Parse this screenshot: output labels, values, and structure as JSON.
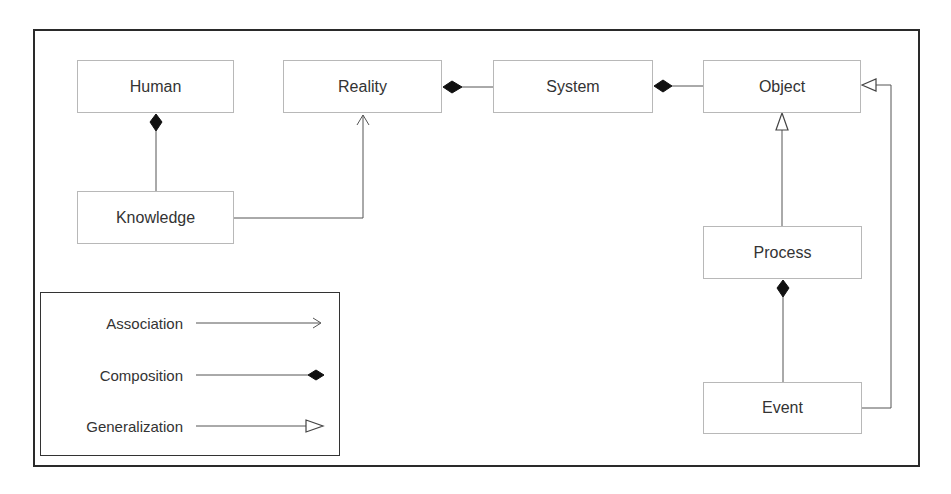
{
  "diagram": {
    "type": "UML class diagram",
    "nodes": {
      "human": "Human",
      "reality": "Reality",
      "system": "System",
      "object": "Object",
      "knowledge": "Knowledge",
      "process": "Process",
      "event": "Event"
    },
    "relations": [
      {
        "from": "Knowledge",
        "to": "Human",
        "type": "Composition"
      },
      {
        "from": "Knowledge",
        "to": "Reality",
        "type": "Association"
      },
      {
        "from": "System",
        "to": "Reality",
        "type": "Composition"
      },
      {
        "from": "Object",
        "to": "System",
        "type": "Composition"
      },
      {
        "from": "Process",
        "to": "Object",
        "type": "Generalization"
      },
      {
        "from": "Event",
        "to": "Process",
        "type": "Composition"
      },
      {
        "from": "Event",
        "to": "Object",
        "type": "Generalization"
      }
    ]
  },
  "legend": {
    "association": "Association",
    "composition": "Composition",
    "generalization": "Generalization"
  }
}
